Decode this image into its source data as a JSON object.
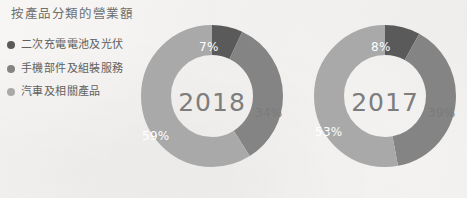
{
  "chart_title": "按產品分類的營業額",
  "colors": {
    "background": "#f4f3f1",
    "series_dark": "#5a5a5a",
    "series_medium": "#848484",
    "series_light": "#a9a9a9",
    "title_text": "#6e6e6e",
    "legend_text": "#5f5f5f",
    "center_label_text": "#7d7d7d",
    "slice_label_text": "#ffffff"
  },
  "legend": {
    "items": [
      {
        "label": "二次充電電池及光伏",
        "color": "#5a5a5a",
        "bullet": "dot-icon"
      },
      {
        "label": "手機部件及組裝服務",
        "color": "#848484",
        "bullet": "dot-icon"
      },
      {
        "label": "汽車及相關產品",
        "color": "#a9a9a9",
        "bullet": "dot-icon"
      }
    ]
  },
  "chart_data": [
    {
      "type": "pie",
      "title": "2018",
      "center_label": "2018",
      "categories": [
        "二次充電電池及光伏",
        "手機部件及組裝服務",
        "汽車及相關產品"
      ],
      "values": [
        7,
        34,
        59
      ],
      "value_labels": [
        "7%",
        "34%",
        "59%"
      ],
      "colors": [
        "#5a5a5a",
        "#848484",
        "#a9a9a9"
      ],
      "donut": true,
      "legend_position": "left",
      "grid": false,
      "xlabel": "",
      "ylabel": ""
    },
    {
      "type": "pie",
      "title": "2017",
      "center_label": "2017",
      "categories": [
        "二次充電電池及光伏",
        "手機部件及組裝服務",
        "汽車及相關產品"
      ],
      "values": [
        8,
        39,
        53
      ],
      "value_labels": [
        "8%",
        "39%",
        "53%"
      ],
      "colors": [
        "#5a5a5a",
        "#848484",
        "#a9a9a9"
      ],
      "donut": true,
      "legend_position": "left",
      "grid": false,
      "xlabel": "",
      "ylabel": ""
    }
  ]
}
